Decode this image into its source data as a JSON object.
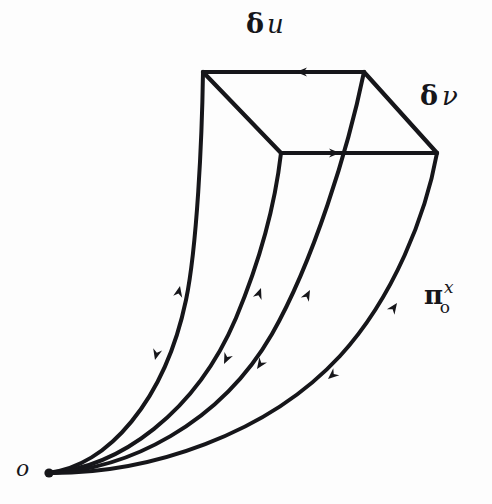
{
  "figure": {
    "background_color": "#fdfdfd",
    "ink_color": "#16161a",
    "width": 492,
    "height": 504
  },
  "labels": {
    "delta_u": {
      "symbol": "δ",
      "variable": "u",
      "full": "δu"
    },
    "delta_nu": {
      "symbol": "δ",
      "variable": "ν",
      "full": "δν"
    },
    "transport_operator": {
      "base": "π",
      "superscript": "x",
      "subscript": "o",
      "full": "π₀ˣ"
    },
    "origin": {
      "text": "o"
    }
  },
  "geometry": {
    "origin_point": {
      "x": 48,
      "y": 473
    },
    "parallelogram": {
      "top_left": {
        "x": 203,
        "y": 72
      },
      "top_right": {
        "x": 364,
        "y": 72
      },
      "inner": {
        "x": 281,
        "y": 153
      },
      "right": {
        "x": 437,
        "y": 153
      }
    },
    "curves": [
      {
        "name": "curve-1",
        "end": {
          "x": 203,
          "y": 72
        },
        "up_arrow": {
          "x": 178,
          "y": 283
        },
        "down_arrow": {
          "x": 157,
          "y": 358
        }
      },
      {
        "name": "curve-2",
        "end": {
          "x": 281,
          "y": 153
        },
        "up_arrow": {
          "x": 259,
          "y": 285
        },
        "down_arrow": {
          "x": 222,
          "y": 362
        }
      },
      {
        "name": "curve-3",
        "end": {
          "x": 364,
          "y": 72
        },
        "up_arrow": {
          "x": 307,
          "y": 288
        },
        "down_arrow": {
          "x": 255,
          "y": 367
        }
      },
      {
        "name": "curve-4",
        "end": {
          "x": 437,
          "y": 153
        },
        "up_arrow": {
          "x": 394,
          "y": 301
        },
        "down_arrow": {
          "x": 325,
          "y": 377
        }
      }
    ],
    "edge_arrows": [
      {
        "name": "top-edge-arrow",
        "direction": "left",
        "x": 300,
        "y": 72
      },
      {
        "name": "inner-edge-arrow",
        "direction": "right",
        "x": 334,
        "y": 153
      }
    ]
  }
}
